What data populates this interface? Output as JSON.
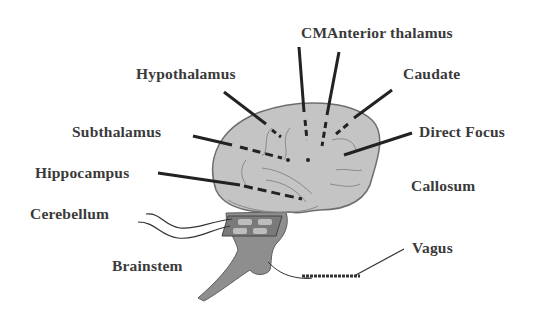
{
  "diagram": {
    "title": "",
    "colors": {
      "cerebrum": "#c4c4c4",
      "brainstem": "#8e8e8e",
      "outline": "#6e6e6e",
      "pointer": "#222222",
      "text": "#3a3a3a"
    },
    "labels": {
      "cm": "CM",
      "anterior_thalamus": "Anterior thalamus",
      "hypothalamus": "Hypothalamus",
      "caudate": "Caudate",
      "subthalamus": "Subthalamus",
      "direct_focus": "Direct Focus",
      "hippocampus": "Hippocampus",
      "callosum": "Callosum",
      "cerebellum": "Cerebellum",
      "brainstem": "Brainstem",
      "vagus": "Vagus"
    }
  }
}
